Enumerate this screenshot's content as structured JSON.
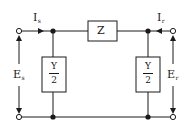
{
  "diagram": {
    "colors": {
      "line": "#1a1a1a",
      "background": "#ffffff"
    },
    "series_impedance": {
      "label": "Z"
    },
    "shunt_left": {
      "numerator": "Y",
      "denominator": "2"
    },
    "shunt_right": {
      "numerator": "Y",
      "denominator": "2"
    },
    "sending_current": {
      "symbol": "I",
      "subscript": "s"
    },
    "receiving_current": {
      "symbol": "I",
      "subscript": "r"
    },
    "sending_voltage": {
      "symbol": "E",
      "subscript": "s"
    },
    "receiving_voltage": {
      "symbol": "E",
      "subscript": "r"
    }
  }
}
